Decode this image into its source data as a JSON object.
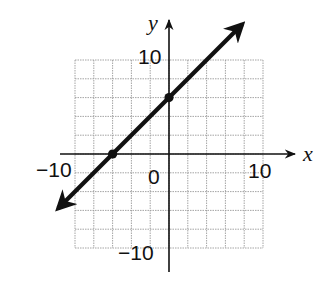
{
  "chart_data": {
    "type": "line",
    "title": "",
    "xlabel": "x",
    "ylabel": "y",
    "xlim": [
      -10,
      10
    ],
    "ylim": [
      -10,
      10
    ],
    "grid": true,
    "grid_step": 2,
    "tick_labels": {
      "x": [
        {
          "value": -10,
          "label": "−10"
        },
        {
          "value": 0,
          "label": "0"
        },
        {
          "value": 10,
          "label": "10"
        }
      ],
      "y": [
        {
          "value": 10,
          "label": "10"
        },
        {
          "value": -10,
          "label": "−10"
        }
      ]
    },
    "series": [
      {
        "name": "line",
        "equation": "y = x + 6",
        "slope": 1,
        "intercept": 6,
        "arrows": "both",
        "marked_points": [
          {
            "x": -6,
            "y": 0
          },
          {
            "x": 0,
            "y": 6
          }
        ]
      }
    ]
  },
  "labels": {
    "x_axis": "x",
    "y_axis": "y",
    "x_neg": "−10",
    "x_pos": "10",
    "origin": "0",
    "y_pos": "10",
    "y_neg": "−10"
  },
  "colors": {
    "grid": "#9a9a9a",
    "axis": "#111111",
    "line": "#111111"
  }
}
